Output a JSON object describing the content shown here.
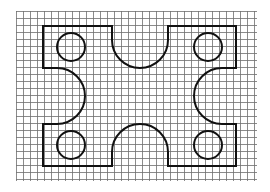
{
  "diagram": {
    "title": "Plate with four semicircular notches and four circular holes on a square grid",
    "grid": {
      "x0": 16,
      "y0": 11,
      "x1": 257,
      "y1": 181,
      "spacing": 7,
      "color": "#6e6e6e"
    },
    "outline": {
      "left": 43,
      "top": 26,
      "right": 236,
      "bottom": 166,
      "color": "#111111",
      "notches": {
        "top": {
          "cx": 140,
          "cy": 40,
          "r": 28
        },
        "bottom": {
          "cx": 140,
          "cy": 152,
          "r": 28
        },
        "left": {
          "cx": 57,
          "cy": 96,
          "r": 28
        },
        "right": {
          "cx": 222,
          "cy": 96,
          "r": 28
        }
      }
    },
    "holes": [
      {
        "name": "top-left",
        "cx": 71,
        "cy": 47,
        "r": 14
      },
      {
        "name": "top-right",
        "cx": 208,
        "cy": 47,
        "r": 14
      },
      {
        "name": "bottom-left",
        "cx": 71,
        "cy": 145,
        "r": 14
      },
      {
        "name": "bottom-right",
        "cx": 208,
        "cy": 145,
        "r": 14
      }
    ]
  }
}
